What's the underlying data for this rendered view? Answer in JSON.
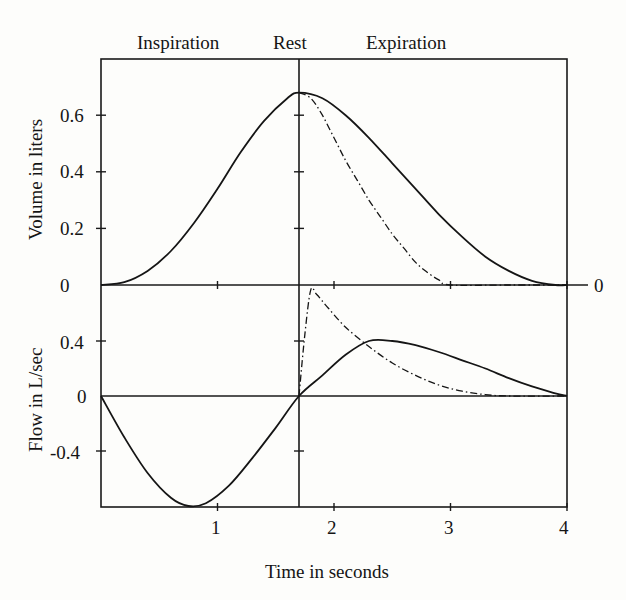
{
  "chart_data": [
    {
      "type": "line",
      "title": "",
      "phase_labels": [
        "Inspiration",
        "Rest",
        "Expiration"
      ],
      "xlabel": "Time in seconds",
      "ylabel": "Volume in liters",
      "xlim": [
        0,
        4
      ],
      "ylim": [
        0,
        0.8
      ],
      "xticks": [
        1,
        2,
        3,
        4
      ],
      "yticks": [
        0,
        0.2,
        0.4,
        0.6
      ],
      "right_label": "0",
      "rest_line_x": 1.7,
      "grid": false,
      "series": [
        {
          "name": "volume (solid)",
          "style": "solid",
          "x": [
            0,
            0.2,
            0.4,
            0.6,
            0.8,
            1.0,
            1.2,
            1.4,
            1.6,
            1.7,
            1.9,
            2.1,
            2.3,
            2.5,
            2.7,
            2.9,
            3.1,
            3.3,
            3.5,
            3.7,
            3.9,
            4.0
          ],
          "y": [
            0,
            0.01,
            0.05,
            0.12,
            0.22,
            0.34,
            0.47,
            0.58,
            0.66,
            0.68,
            0.66,
            0.6,
            0.52,
            0.43,
            0.34,
            0.25,
            0.17,
            0.1,
            0.05,
            0.015,
            0.0,
            0.0
          ]
        },
        {
          "name": "volume (dash-dot)",
          "style": "dash-dot",
          "x": [
            1.7,
            1.8,
            1.9,
            2.0,
            2.1,
            2.2,
            2.3,
            2.4,
            2.5,
            2.6,
            2.7,
            2.8,
            2.9,
            3.0,
            3.5,
            4.0
          ],
          "y": [
            0.68,
            0.66,
            0.6,
            0.52,
            0.44,
            0.37,
            0.3,
            0.24,
            0.18,
            0.13,
            0.08,
            0.045,
            0.018,
            0.0,
            0.0,
            0.0
          ]
        }
      ]
    },
    {
      "type": "line",
      "title": "",
      "xlabel": "Time in seconds",
      "ylabel": "Flow in L/sec",
      "xlim": [
        0,
        4
      ],
      "ylim": [
        -0.8,
        0.8
      ],
      "xticks": [
        1,
        2,
        3,
        4
      ],
      "yticks": [
        -0.4,
        0,
        0.4
      ],
      "rest_line_x": 1.7,
      "grid": false,
      "series": [
        {
          "name": "flow (solid)",
          "style": "solid",
          "x": [
            0,
            0.2,
            0.4,
            0.6,
            0.75,
            0.9,
            1.1,
            1.3,
            1.5,
            1.7,
            1.9,
            2.1,
            2.3,
            2.5,
            2.7,
            2.9,
            3.1,
            3.3,
            3.5,
            3.7,
            3.9,
            4.0
          ],
          "y": [
            0,
            -0.3,
            -0.56,
            -0.74,
            -0.8,
            -0.78,
            -0.65,
            -0.45,
            -0.23,
            0,
            0.15,
            0.3,
            0.4,
            0.4,
            0.37,
            0.32,
            0.26,
            0.2,
            0.13,
            0.07,
            0.02,
            0
          ]
        },
        {
          "name": "flow (dash-dot)",
          "style": "dash-dot",
          "x": [
            1.7,
            1.75,
            1.8,
            1.85,
            1.95,
            2.1,
            2.3,
            2.5,
            2.7,
            2.9,
            3.1,
            3.3,
            3.5,
            4.0
          ],
          "y": [
            0,
            0.45,
            0.77,
            0.74,
            0.64,
            0.5,
            0.36,
            0.24,
            0.15,
            0.08,
            0.035,
            0.01,
            0.0,
            0.0
          ]
        }
      ]
    }
  ],
  "labels": {
    "inspiration": "Inspiration",
    "rest": "Rest",
    "expiration": "Expiration",
    "volume_axis": "Volume in liters",
    "flow_axis": "Flow in L/sec",
    "time_axis": "Time in seconds",
    "right_zero": "0",
    "vol_ticks": [
      "0.6",
      "0.4",
      "0.2",
      "0"
    ],
    "flow_ticks": [
      "0.4",
      "0",
      "-0.4"
    ],
    "time_ticks": [
      "1",
      "2",
      "3",
      "4"
    ]
  }
}
